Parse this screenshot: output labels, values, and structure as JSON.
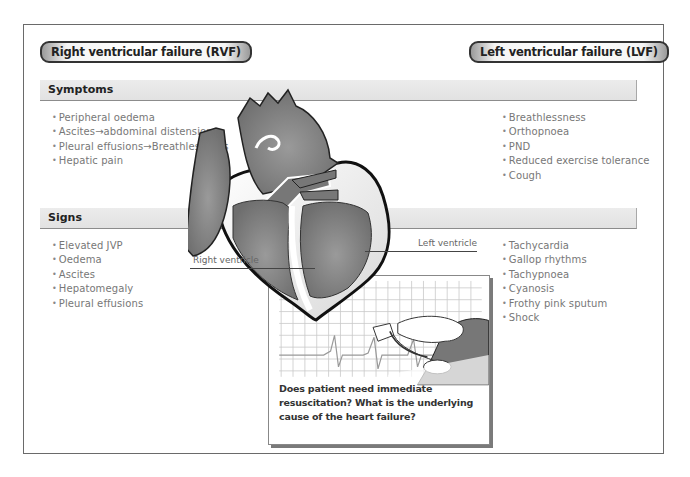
{
  "headers": {
    "rvf": "Right ventricular failure (RVF)",
    "lvf": "Left ventricular failure (LVF)"
  },
  "sections": {
    "symptoms": {
      "title": "Symptoms",
      "rvf": [
        "Peripheral oedema",
        "Ascites→abdominal distension",
        "Pleural effusions→Breathlessness",
        "Hepatic pain"
      ],
      "lvf": [
        "Breathlessness",
        "Orthopnoea",
        "PND",
        "Reduced exercise tolerance",
        "Cough"
      ]
    },
    "signs": {
      "title": "Signs",
      "rvf": [
        "Elevated JVP",
        "Oedema",
        "Ascites",
        "Hepatomegaly",
        "Pleural effusions"
      ],
      "lvf": [
        "Tachycardia",
        "Gallop rhythms",
        "Tachypnoea",
        "Cyanosis",
        "Frothy pink sputum",
        "Shock"
      ]
    }
  },
  "diagram": {
    "labels": {
      "right_ventricle": "Right ventricle",
      "left_ventricle": "Left ventricle"
    },
    "colors": {
      "heart_fill": "#7e7e7e",
      "heart_dark": "#5f5f5f",
      "outline": "#111111",
      "bar_fill": "#e6e6e6"
    }
  },
  "ecg_panel": {
    "caption": "Does patient need immediate resuscitation? What is the underlying cause of the heart failure?"
  }
}
